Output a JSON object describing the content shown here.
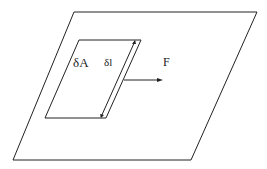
{
  "diagram": {
    "labels": {
      "area": "δA",
      "length": "δl",
      "force": "F"
    },
    "colors": {
      "stroke": "#222222",
      "background": "#ffffff"
    }
  }
}
